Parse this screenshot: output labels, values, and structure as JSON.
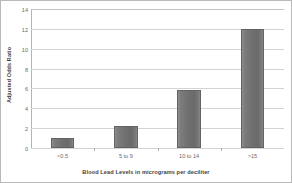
{
  "chart_data": {
    "type": "bar",
    "title": "",
    "categories": [
      "<0.5",
      "5 to 9",
      "10 to 14",
      ">15"
    ],
    "values": [
      1.0,
      2.2,
      5.8,
      12.0
    ],
    "xlabel": "Blood Lead Levels in micrograms per deciliter",
    "ylabel": "Adjusted Odds Ratio",
    "ylim": [
      0,
      14
    ],
    "ytick_labels": [
      "0",
      "2",
      "4",
      "6",
      "8",
      "10",
      "12",
      "14"
    ],
    "ytick_values": [
      0,
      2,
      4,
      6,
      8,
      10,
      12,
      14
    ],
    "grid": true,
    "legend": false,
    "bar_color": "#707070",
    "bar_edge_color": "#636363",
    "gridline_color": "#d3d3d3",
    "axis_color": "#a8a8a8",
    "text_color": "#6a6a6a",
    "title_color": "#3f3f3f"
  }
}
